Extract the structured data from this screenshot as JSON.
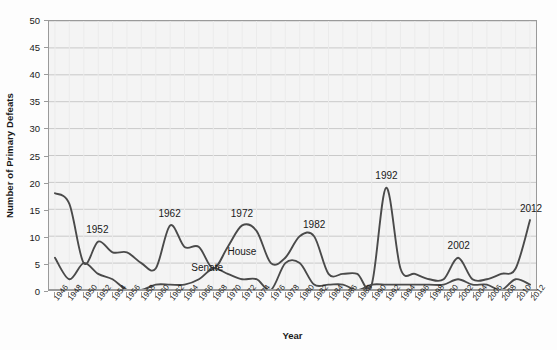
{
  "chart_data": {
    "type": "line",
    "title": "",
    "xlabel": "Year",
    "ylabel": "Number of Primary Defeats",
    "xlim": [
      1946,
      2012
    ],
    "ylim": [
      0,
      50
    ],
    "grid": true,
    "legend_position": "inline-labels",
    "line_color": "#4a4a4a",
    "plot_background": "#f4f4f4",
    "gridline_color": "#c9c9c9",
    "border_color": "#9a9a9a",
    "y_ticks": [
      0,
      5,
      10,
      15,
      20,
      25,
      30,
      35,
      40,
      45,
      50
    ],
    "x": [
      1946,
      1948,
      1950,
      1952,
      1954,
      1956,
      1958,
      1960,
      1962,
      1964,
      1966,
      1968,
      1970,
      1972,
      1974,
      1976,
      1978,
      1980,
      1982,
      1984,
      1986,
      1988,
      1990,
      1992,
      1994,
      1996,
      1998,
      2000,
      2002,
      2004,
      2006,
      2008,
      2010,
      2012
    ],
    "categories": [
      "1946",
      "1948",
      "1950",
      "1952",
      "1954",
      "1956",
      "1958",
      "1960",
      "1962",
      "1964",
      "1966",
      "1968",
      "1970",
      "1972",
      "1974",
      "1976",
      "1978",
      "1980",
      "1982",
      "1984",
      "1986",
      "1988",
      "1990",
      "1992",
      "1994",
      "1996",
      "1998",
      "2000",
      "2002",
      "2004",
      "2006",
      "2008",
      "2010",
      "2012"
    ],
    "series": [
      {
        "name": "House",
        "values": [
          18,
          16,
          5,
          9,
          7,
          7,
          5,
          4,
          12,
          8,
          8,
          4,
          8,
          12,
          11,
          5,
          6,
          10,
          10,
          3,
          3,
          3,
          1,
          19,
          4,
          3,
          2,
          2,
          6,
          2,
          2,
          3,
          4,
          13
        ]
      },
      {
        "name": "Senate",
        "values": [
          6,
          2,
          5,
          3,
          2,
          0,
          0,
          1,
          1,
          1,
          2,
          4,
          3,
          2,
          2,
          0,
          5,
          5,
          1,
          1,
          1,
          0,
          1,
          1,
          1,
          1,
          1,
          1,
          2,
          1,
          1,
          0,
          2,
          1
        ]
      }
    ],
    "annotations": [
      {
        "label": "1952",
        "x": 1952,
        "y": 9
      },
      {
        "label": "1962",
        "x": 1962,
        "y": 12
      },
      {
        "label": "1972",
        "x": 1972,
        "y": 12
      },
      {
        "label": "1982",
        "x": 1982,
        "y": 10
      },
      {
        "label": "1992",
        "x": 1992,
        "y": 19
      },
      {
        "label": "2002",
        "x": 2002,
        "y": 6
      },
      {
        "label": "2012",
        "x": 2012,
        "y": 13
      }
    ],
    "series_labels": [
      {
        "label": "House",
        "x": 1970,
        "y": 7
      },
      {
        "label": "Senate",
        "x": 1965,
        "y": 4
      }
    ]
  }
}
